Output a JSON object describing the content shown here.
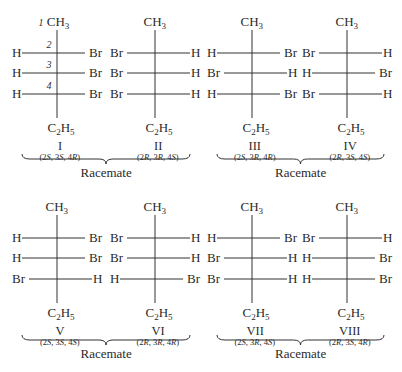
{
  "diagram": {
    "top_group": "CH3",
    "bottom_group": "C2H5",
    "carbon_numbers": [
      "1",
      "2",
      "3",
      "4"
    ],
    "molecules": [
      {
        "id": "I",
        "rows": [
          [
            "H",
            "Br"
          ],
          [
            "H",
            "Br"
          ],
          [
            "H",
            "Br"
          ]
        ],
        "config": "(2S, 3S, 4R)",
        "show_numbers": true
      },
      {
        "id": "II",
        "rows": [
          [
            "Br",
            "H"
          ],
          [
            "Br",
            "H"
          ],
          [
            "Br",
            "H"
          ]
        ],
        "config": "(2R, 3R, 4S)",
        "show_numbers": false
      },
      {
        "id": "III",
        "rows": [
          [
            "H",
            "Br"
          ],
          [
            "Br",
            "H"
          ],
          [
            "H",
            "Br"
          ]
        ],
        "config": "(2S, 3R, 4R)",
        "show_numbers": false
      },
      {
        "id": "IV",
        "rows": [
          [
            "Br",
            "H"
          ],
          [
            "H",
            "Br"
          ],
          [
            "Br",
            "H"
          ]
        ],
        "config": "(2R, 3S, 4S)",
        "show_numbers": false
      },
      {
        "id": "V",
        "rows": [
          [
            "H",
            "Br"
          ],
          [
            "H",
            "Br"
          ],
          [
            "Br",
            "H"
          ]
        ],
        "config": "(2S, 3S, 4S)",
        "show_numbers": false
      },
      {
        "id": "VI",
        "rows": [
          [
            "Br",
            "H"
          ],
          [
            "Br",
            "H"
          ],
          [
            "H",
            "Br"
          ]
        ],
        "config": "(2R, 3R, 4R)",
        "show_numbers": false
      },
      {
        "id": "VII",
        "rows": [
          [
            "H",
            "Br"
          ],
          [
            "Br",
            "H"
          ],
          [
            "Br",
            "H"
          ]
        ],
        "config": "(2S, 3R, 4S)",
        "show_numbers": false
      },
      {
        "id": "VIII",
        "rows": [
          [
            "Br",
            "H"
          ],
          [
            "H",
            "Br"
          ],
          [
            "H",
            "Br"
          ]
        ],
        "config": "(2R, 3S, 4R)",
        "show_numbers": false
      }
    ],
    "racemates": [
      {
        "label": "Racemate",
        "pair": [
          "I",
          "II"
        ]
      },
      {
        "label": "Racemate",
        "pair": [
          "III",
          "IV"
        ]
      },
      {
        "label": "Racemate",
        "pair": [
          "V",
          "VI"
        ]
      },
      {
        "label": "Racemate",
        "pair": [
          "VII",
          "VIII"
        ]
      }
    ]
  }
}
